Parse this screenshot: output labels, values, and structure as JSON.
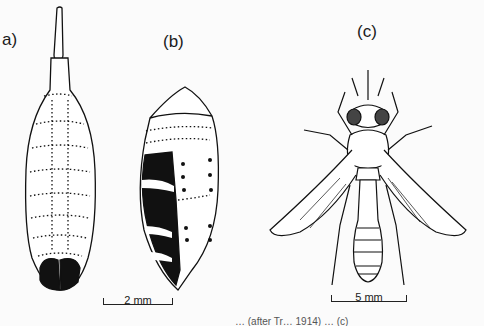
{
  "figure": {
    "panels": [
      {
        "label": "a)",
        "subject": "larva"
      },
      {
        "label": "(b)",
        "subject": "puparium"
      },
      {
        "label": "(c)",
        "subject": "adult fly"
      }
    ],
    "scale_bars": [
      {
        "label": "2 mm"
      },
      {
        "label": "5 mm"
      }
    ],
    "caption_partial": "… (after Tr… 1914) … (c)"
  }
}
